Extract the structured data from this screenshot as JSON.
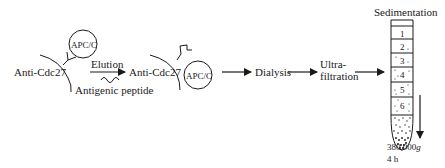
{
  "diagram": {
    "step1": {
      "antibody_label": "Anti-Cdc27",
      "complex_label": "APC/C",
      "arrow_label": "Elution",
      "peptide_label": "Antigenic peptide"
    },
    "step2": {
      "antibody_label": "Anti-Cdc27",
      "complex_label": "APC/C"
    },
    "step3": {
      "label": "Dialysis"
    },
    "step4": {
      "label_line1": "Ultra-",
      "label_line2": "filtration"
    },
    "step5": {
      "title": "Sedimentation",
      "fractions": [
        "1",
        "2",
        "3",
        "4",
        "5",
        "6"
      ],
      "speed": "380,000",
      "speed_unit": "g",
      "duration": "4 h"
    },
    "colors": {
      "ink": "#1a1a1a",
      "background": "#ffffff"
    }
  }
}
